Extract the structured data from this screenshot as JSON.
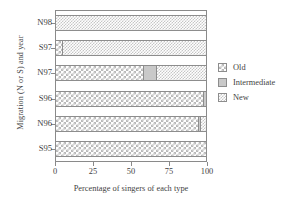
{
  "chart_data": {
    "type": "bar",
    "orientation": "horizontal",
    "stacked": true,
    "normalized_percent": true,
    "title": "",
    "xlabel": "Percentage of singers of each type",
    "ylabel": "Migration (N or S) and year",
    "xlim": [
      0,
      100
    ],
    "xticks": [
      0,
      25,
      50,
      75,
      100
    ],
    "xticklabels": [
      "0",
      "25",
      "50",
      "75",
      "100"
    ],
    "grid": false,
    "legend_position": "right",
    "categories": [
      "N98",
      "S97",
      "N97",
      "S96",
      "N96",
      "S95"
    ],
    "series": [
      {
        "name": "Old",
        "pattern": "dotted-open-checker",
        "values": [
          0,
          4,
          58,
          98,
          95,
          100
        ]
      },
      {
        "name": "Intermediate",
        "pattern": "solid-light-gray",
        "values": [
          0,
          0,
          9,
          2,
          1,
          0
        ]
      },
      {
        "name": "New",
        "pattern": "dense-fine-checker",
        "values": [
          100,
          96,
          33,
          0,
          4,
          0
        ]
      }
    ],
    "bars": [
      {
        "category": "N98",
        "segments": [
          {
            "series": "New",
            "start": 0,
            "end": 100,
            "value": 100
          }
        ]
      },
      {
        "category": "S97",
        "segments": [
          {
            "series": "Old",
            "start": 0,
            "end": 4,
            "value": 4
          },
          {
            "series": "New",
            "start": 4,
            "end": 100,
            "value": 96
          }
        ]
      },
      {
        "category": "N97",
        "segments": [
          {
            "series": "Old",
            "start": 0,
            "end": 58,
            "value": 58
          },
          {
            "series": "Intermediate",
            "start": 58,
            "end": 67,
            "value": 9
          },
          {
            "series": "New",
            "start": 67,
            "end": 100,
            "value": 33
          }
        ]
      },
      {
        "category": "S96",
        "segments": [
          {
            "series": "Old",
            "start": 0,
            "end": 98,
            "value": 98
          },
          {
            "series": "Intermediate",
            "start": 98,
            "end": 100,
            "value": 2
          }
        ]
      },
      {
        "category": "N96",
        "segments": [
          {
            "series": "Old",
            "start": 0,
            "end": 95,
            "value": 95
          },
          {
            "series": "Intermediate",
            "start": 95,
            "end": 96,
            "value": 1
          },
          {
            "series": "New",
            "start": 96,
            "end": 100,
            "value": 4
          }
        ]
      },
      {
        "category": "S95",
        "segments": [
          {
            "series": "Old",
            "start": 0,
            "end": 100,
            "value": 100
          }
        ]
      }
    ]
  },
  "axes": {
    "ylabel": "Migration (N or S) and year",
    "xlabel": "Percentage of singers of each type",
    "yticklabels": [
      "N98",
      "S97",
      "N97",
      "S96",
      "N96",
      "S95"
    ],
    "xticklabels": [
      "0",
      "25",
      "50",
      "75",
      "100"
    ]
  },
  "legend": {
    "entries": [
      {
        "label": "Old"
      },
      {
        "label": "Intermediate"
      },
      {
        "label": "New"
      }
    ]
  },
  "colors": {
    "frame": "#8a8a8a",
    "text": "#3f3f3f",
    "intermediate_fill": "#c9c9c9",
    "pattern_line": "#b9b9b9",
    "background": "#ffffff"
  }
}
